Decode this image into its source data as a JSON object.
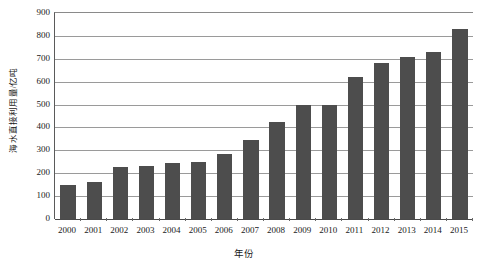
{
  "chart_data": {
    "type": "bar",
    "title": "",
    "subtitle": "",
    "xlabel": "年份",
    "ylabel": "海水直接利用量/亿吨",
    "categories": [
      "2000",
      "2001",
      "2002",
      "2003",
      "2004",
      "2005",
      "2006",
      "2007",
      "2008",
      "2009",
      "2010",
      "2011",
      "2012",
      "2013",
      "2014",
      "2015"
    ],
    "values": [
      150,
      160,
      228,
      233,
      245,
      250,
      283,
      345,
      425,
      500,
      500,
      620,
      680,
      708,
      728,
      832
    ],
    "series": [
      {
        "name": "海水直接利用量",
        "values": [
          150,
          160,
          228,
          233,
          245,
          250,
          283,
          345,
          425,
          500,
          500,
          620,
          680,
          708,
          728,
          832
        ]
      }
    ],
    "ylim": [
      0,
      900
    ],
    "yticks": [
      0,
      100,
      200,
      300,
      400,
      500,
      600,
      700,
      800,
      900
    ],
    "ytick_labels": [
      "0",
      "100",
      "200",
      "300",
      "400",
      "500",
      "600",
      "700",
      "800",
      "900"
    ],
    "grid": true,
    "grid_axis": "y",
    "legend": false,
    "legend_position": "none",
    "bar_color": "#4d4d4d",
    "gridline_color": "#9a9a9a",
    "axis_color": "#4a4a4a",
    "background_color": "#ffffff"
  }
}
